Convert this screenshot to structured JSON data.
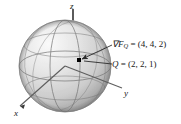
{
  "figure": {
    "kind": "3d-sphere-gradient-diagram",
    "background_color": "#ffffff",
    "ink_color": "#1a1a1a"
  },
  "axes": {
    "z_label": "z",
    "y_label": "y",
    "x_label": "x"
  },
  "sphere": {
    "fill_light": "#f2f2f2",
    "fill_mid": "#d8d8d8",
    "fill_dark": "#9a9a9a",
    "grid_color": "#6f6f6f",
    "center_px": [
      65,
      66
    ],
    "radius_px": 46
  },
  "point": {
    "marker_label": "Q",
    "marker_color": "#000000",
    "position_px": [
      79,
      60
    ]
  },
  "annotations": [
    {
      "name": "gradient-label",
      "symbol": "∇F",
      "subscript": "Q",
      "equals": " = ",
      "value": "(4, 4, 2)"
    },
    {
      "name": "point-label",
      "symbol": "Q",
      "subscript": "",
      "equals": " = ",
      "value": "(2, 2, 1)"
    }
  ],
  "annotation_text": {
    "gradient_full": "∇F_Q = (4, 4, 2)",
    "point_full": "Q = (2, 2, 1)",
    "gradient_value": "(4, 4, 2)",
    "point_value": "(2, 2, 1)",
    "gradient_symbol": "∇F",
    "gradient_subscript": "Q",
    "point_symbol": "Q",
    "equals_sign": " = "
  }
}
